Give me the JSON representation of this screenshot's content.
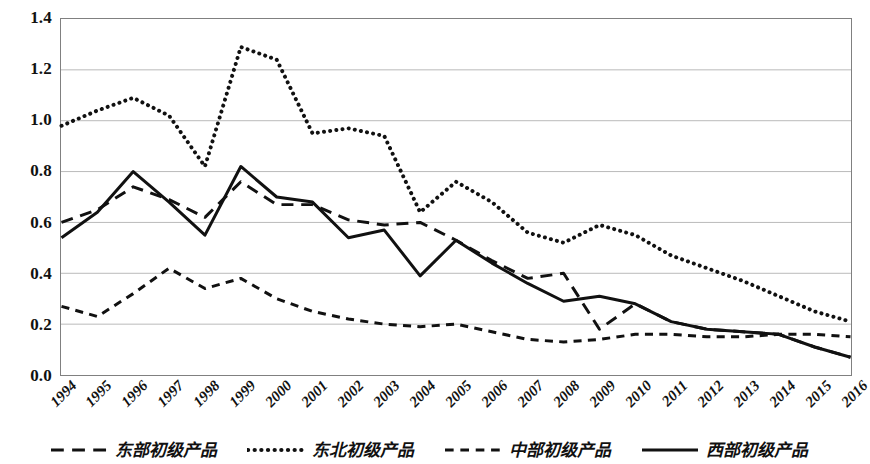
{
  "chart_data": {
    "type": "line",
    "title": "",
    "xlabel": "",
    "ylabel": "",
    "xlim": [
      1994,
      2016
    ],
    "ylim": [
      0.0,
      1.4
    ],
    "grid": true,
    "legend_position": "bottom",
    "y_ticks": [
      "0.0",
      "0.2",
      "0.4",
      "0.6",
      "0.8",
      "1.0",
      "1.2",
      "1.4"
    ],
    "y_tick_values": [
      0.0,
      0.2,
      0.4,
      0.6,
      0.8,
      1.0,
      1.2,
      1.4
    ],
    "categories": [
      "1994",
      "1995",
      "1996",
      "1997",
      "1998",
      "1999",
      "2000",
      "2001",
      "2002",
      "2003",
      "2004",
      "2005",
      "2006",
      "2007",
      "2008",
      "2009",
      "2010",
      "2011",
      "2012",
      "2013",
      "2014",
      "2015",
      "2016"
    ],
    "series": [
      {
        "name": "东部初级产品",
        "style": "dashed",
        "color": "#111111",
        "values": [
          0.6,
          0.65,
          0.74,
          0.69,
          0.62,
          0.76,
          0.67,
          0.67,
          0.61,
          0.59,
          0.6,
          0.53,
          0.45,
          0.38,
          0.4,
          0.18,
          0.28,
          0.21,
          0.18,
          0.17,
          0.16,
          0.11,
          0.07
        ]
      },
      {
        "name": "东北初级产品",
        "style": "dotted",
        "color": "#111111",
        "values": [
          0.98,
          1.04,
          1.09,
          1.02,
          0.82,
          1.29,
          1.24,
          0.95,
          0.97,
          0.94,
          0.64,
          0.76,
          0.68,
          0.56,
          0.52,
          0.59,
          0.55,
          0.47,
          0.42,
          0.37,
          0.31,
          0.25,
          0.21
        ]
      },
      {
        "name": "中部初级产品",
        "style": "shortdash",
        "color": "#111111",
        "values": [
          0.27,
          0.23,
          0.32,
          0.42,
          0.34,
          0.38,
          0.3,
          0.25,
          0.22,
          0.2,
          0.19,
          0.2,
          0.17,
          0.14,
          0.13,
          0.14,
          0.16,
          0.16,
          0.15,
          0.15,
          0.16,
          0.16,
          0.15
        ]
      },
      {
        "name": "西部初级产品",
        "style": "solid",
        "color": "#111111",
        "values": [
          0.54,
          0.64,
          0.8,
          0.68,
          0.55,
          0.82,
          0.7,
          0.68,
          0.54,
          0.57,
          0.39,
          0.53,
          0.44,
          0.36,
          0.29,
          0.31,
          0.28,
          0.21,
          0.18,
          0.17,
          0.16,
          0.11,
          0.07
        ]
      }
    ]
  },
  "legend": {
    "items": [
      {
        "label": "东部初级产品",
        "style": "dashed"
      },
      {
        "label": "东北初级产品",
        "style": "dotted"
      },
      {
        "label": "中部初级产品",
        "style": "shortdash"
      },
      {
        "label": "西部初级产品",
        "style": "solid"
      }
    ]
  }
}
